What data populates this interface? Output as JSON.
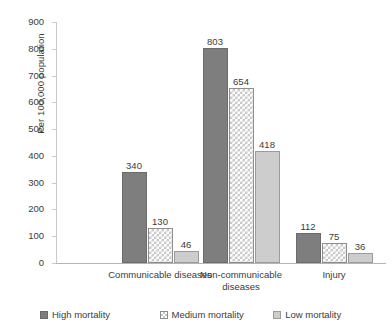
{
  "chart_data": {
    "type": "bar",
    "title": "",
    "xlabel": "",
    "ylabel": "Per 100,000 population",
    "ylim": [
      0,
      900
    ],
    "ytick_step": 100,
    "yticks": [
      0,
      100,
      200,
      300,
      400,
      500,
      600,
      700,
      800,
      900
    ],
    "ytick_labels": [
      "0",
      "100",
      "200",
      "300",
      "400",
      "500",
      "600",
      "700",
      "800",
      "900"
    ],
    "grid": false,
    "legend_position": "bottom",
    "categories": [
      "Communicable diseases",
      "Non-communicable diseases",
      "Injury"
    ],
    "series": [
      {
        "name": "High mortality",
        "values": [
          340,
          803,
          112
        ],
        "color": "#7e7e7e",
        "pattern": "solid"
      },
      {
        "name": "Medium mortality",
        "values": [
          130,
          654,
          75
        ],
        "color": "#ffffff",
        "pattern": "checkerboard"
      },
      {
        "name": "Low mortality",
        "values": [
          46,
          418,
          36
        ],
        "color": "#cdcdcd",
        "pattern": "solid"
      }
    ],
    "value_labels": [
      [
        "340",
        "130",
        "46"
      ],
      [
        "803",
        "654",
        "418"
      ],
      [
        "112",
        "75",
        "36"
      ]
    ]
  },
  "axis": {
    "y_title": "Per 100,000 population"
  },
  "categories": {
    "c0_line1": "Communicable diseases",
    "c0_line2": "",
    "c1_line1": "Non-communicable",
    "c1_line2": "diseases",
    "c2_line1": "Injury",
    "c2_line2": ""
  },
  "legend": {
    "items": [
      {
        "label": "High mortality"
      },
      {
        "label": "Medium mortality"
      },
      {
        "label": "Low mortality"
      }
    ]
  }
}
